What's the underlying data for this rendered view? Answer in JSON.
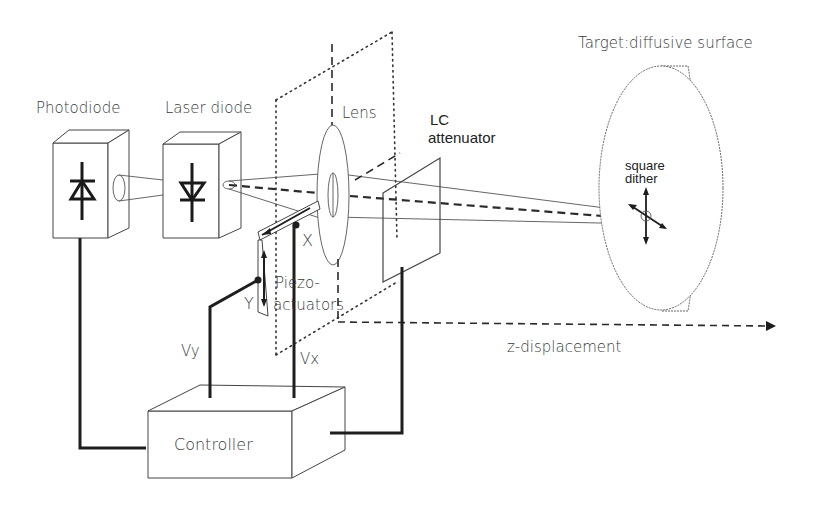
{
  "diagram": {
    "labels": {
      "photodiode": "Photodiode",
      "laser_diode": "Laser diode",
      "lens": "Lens",
      "lc_attenuator_line1": "LC",
      "lc_attenuator_line2": "attenuator",
      "target": "Target:diffusive surface",
      "square_dither_line1": "square",
      "square_dither_line2": "dither",
      "x_axis": "X",
      "y_axis": "Y",
      "piezo_line1": "Piezo-",
      "piezo_line2": "actuators",
      "vy": "Vy",
      "vx": "Vx",
      "z_displacement": "z-displacement",
      "controller": "Controller"
    },
    "components": [
      {
        "id": "photodiode",
        "type": "box-3d",
        "label": "Photodiode"
      },
      {
        "id": "laser-diode",
        "type": "box-3d",
        "label": "Laser diode"
      },
      {
        "id": "lens",
        "type": "lens",
        "label": "Lens"
      },
      {
        "id": "piezo-actuators",
        "type": "actuator",
        "label": "Piezo-actuators"
      },
      {
        "id": "lc-attenuator",
        "type": "plate",
        "label": "LC attenuator"
      },
      {
        "id": "target",
        "type": "disc",
        "label": "Target:diffusive surface"
      },
      {
        "id": "controller",
        "type": "box-3d",
        "label": "Controller"
      }
    ],
    "connections": [
      {
        "from": "controller",
        "to": "photodiode",
        "style": "wire"
      },
      {
        "from": "controller",
        "to": "piezo-y",
        "label": "Vy",
        "style": "wire"
      },
      {
        "from": "controller",
        "to": "piezo-x",
        "label": "Vx",
        "style": "wire"
      },
      {
        "from": "controller",
        "to": "lc-attenuator",
        "style": "wire"
      },
      {
        "from": "laser-diode",
        "to": "target",
        "style": "beam"
      },
      {
        "from": "lens",
        "to": "arrow-end",
        "label": "z-displacement",
        "style": "dashed-arrow"
      }
    ]
  }
}
